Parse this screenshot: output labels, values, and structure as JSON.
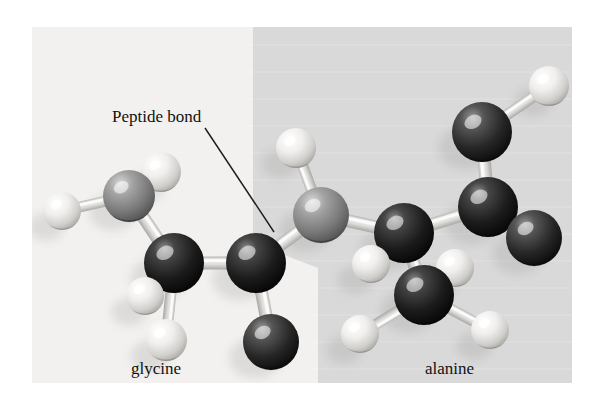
{
  "figure": {
    "type": "molecular-ball-and-stick-model",
    "canvas": {
      "width": 598,
      "height": 404,
      "background": "#ffffff"
    },
    "plate": {
      "x": 32,
      "y": 27,
      "width": 540,
      "height": 356
    },
    "background_panels": [
      {
        "name": "glycine-panel",
        "shade": "#f2f1ef",
        "side": "left"
      },
      {
        "name": "alanine-panel",
        "shade": "#d9d9d9",
        "side": "right"
      }
    ],
    "panel_divider": {
      "description": "vertical boundary that jogs diagonally to the right at mid-height",
      "points": "253,27 253,243 318,268 318,383"
    }
  },
  "annotations": {
    "callout": {
      "label": "Peptide bond",
      "text_x": 112,
      "text_y": 122,
      "font_size": 17,
      "leader_line": {
        "x1": 205,
        "y1": 128,
        "x2": 274,
        "y2": 232,
        "color": "#1a1a1a",
        "width": 1.4
      }
    }
  },
  "captions": [
    {
      "name": "glycine-caption",
      "text": "glycine",
      "x": 131,
      "y": 374,
      "font_size": 17
    },
    {
      "name": "alanine-caption",
      "text": "alanine",
      "x": 425,
      "y": 374,
      "font_size": 17
    }
  ],
  "legend": {
    "atom_colors": {
      "hydrogen": "#ededeb",
      "carbon": "#1c1c1c",
      "nitrogen": "#8a8a8a",
      "oxygen": "#2b2b2b",
      "bond": "#dcdcda"
    },
    "atom_labels": {
      "hydrogen": "H",
      "carbon": "C",
      "nitrogen": "N",
      "oxygen": "O"
    }
  },
  "molecule": {
    "atoms": [
      {
        "id": "gly-h-n1",
        "element": "hydrogen",
        "cx": 62,
        "cy": 211,
        "r": 19,
        "residue": "glycine"
      },
      {
        "id": "gly-n",
        "element": "nitrogen",
        "cx": 129,
        "cy": 196,
        "r": 26,
        "residue": "glycine"
      },
      {
        "id": "gly-h-n2",
        "element": "hydrogen",
        "cx": 161,
        "cy": 172,
        "r": 20,
        "residue": "glycine"
      },
      {
        "id": "gly-ca",
        "element": "carbon",
        "cx": 174,
        "cy": 263,
        "r": 30,
        "residue": "glycine"
      },
      {
        "id": "gly-h-a1",
        "element": "hydrogen",
        "cx": 145,
        "cy": 296,
        "r": 19,
        "residue": "glycine"
      },
      {
        "id": "gly-h-a2",
        "element": "hydrogen",
        "cx": 166,
        "cy": 340,
        "r": 21,
        "residue": "glycine"
      },
      {
        "id": "gly-c",
        "element": "carbon",
        "cx": 256,
        "cy": 263,
        "r": 30,
        "residue": "glycine"
      },
      {
        "id": "gly-o",
        "element": "oxygen",
        "cx": 271,
        "cy": 342,
        "r": 28,
        "residue": "glycine"
      },
      {
        "id": "pep-n",
        "element": "nitrogen",
        "cx": 321,
        "cy": 215,
        "r": 28,
        "residue": "peptide-bond"
      },
      {
        "id": "pep-h",
        "element": "hydrogen",
        "cx": 296,
        "cy": 148,
        "r": 20,
        "residue": "peptide-bond"
      },
      {
        "id": "ala-ca",
        "element": "carbon",
        "cx": 404,
        "cy": 233,
        "r": 30,
        "residue": "alanine"
      },
      {
        "id": "ala-h-a",
        "element": "hydrogen",
        "cx": 371,
        "cy": 264,
        "r": 19,
        "residue": "alanine"
      },
      {
        "id": "ala-cb",
        "element": "carbon",
        "cx": 424,
        "cy": 295,
        "r": 30,
        "residue": "alanine"
      },
      {
        "id": "ala-h-b1",
        "element": "hydrogen",
        "cx": 455,
        "cy": 268,
        "r": 19,
        "residue": "alanine"
      },
      {
        "id": "ala-h-b2",
        "element": "hydrogen",
        "cx": 360,
        "cy": 334,
        "r": 19,
        "residue": "alanine"
      },
      {
        "id": "ala-h-b3",
        "element": "hydrogen",
        "cx": 490,
        "cy": 330,
        "r": 19,
        "residue": "alanine"
      },
      {
        "id": "ala-c",
        "element": "carbon",
        "cx": 488,
        "cy": 207,
        "r": 30,
        "residue": "alanine"
      },
      {
        "id": "ala-o1",
        "element": "oxygen",
        "cx": 534,
        "cy": 238,
        "r": 28,
        "residue": "alanine"
      },
      {
        "id": "ala-o2",
        "element": "oxygen",
        "cx": 482,
        "cy": 132,
        "r": 30,
        "residue": "alanine"
      },
      {
        "id": "ala-h-o",
        "element": "hydrogen",
        "cx": 549,
        "cy": 86,
        "r": 20,
        "residue": "alanine"
      }
    ],
    "bonds": [
      {
        "from": "gly-h-n1",
        "to": "gly-n",
        "width": 11
      },
      {
        "from": "gly-n",
        "to": "gly-h-n2",
        "width": 11
      },
      {
        "from": "gly-n",
        "to": "gly-ca",
        "width": 13
      },
      {
        "from": "gly-ca",
        "to": "gly-h-a1",
        "width": 11
      },
      {
        "from": "gly-ca",
        "to": "gly-h-a2",
        "width": 11
      },
      {
        "from": "gly-ca",
        "to": "gly-c",
        "width": 13
      },
      {
        "from": "gly-c",
        "to": "gly-o",
        "width": 13
      },
      {
        "from": "gly-c",
        "to": "pep-n",
        "width": 13,
        "highlight": "peptide-bond"
      },
      {
        "from": "pep-n",
        "to": "pep-h",
        "width": 11
      },
      {
        "from": "pep-n",
        "to": "ala-ca",
        "width": 13
      },
      {
        "from": "ala-ca",
        "to": "ala-h-a",
        "width": 11
      },
      {
        "from": "ala-ca",
        "to": "ala-cb",
        "width": 13
      },
      {
        "from": "ala-cb",
        "to": "ala-h-b1",
        "width": 11
      },
      {
        "from": "ala-cb",
        "to": "ala-h-b2",
        "width": 11
      },
      {
        "from": "ala-cb",
        "to": "ala-h-b3",
        "width": 11
      },
      {
        "from": "ala-ca",
        "to": "ala-c",
        "width": 13
      },
      {
        "from": "ala-c",
        "to": "ala-o1",
        "width": 13
      },
      {
        "from": "ala-c",
        "to": "ala-o2",
        "width": 13
      },
      {
        "from": "ala-o2",
        "to": "ala-h-o",
        "width": 11
      }
    ]
  }
}
